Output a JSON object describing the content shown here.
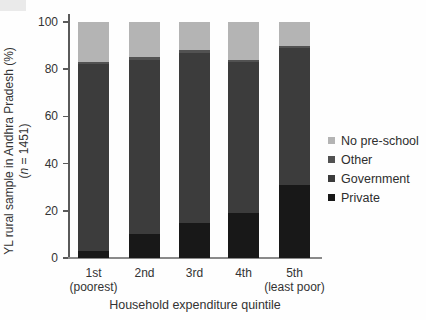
{
  "chart_data": {
    "type": "bar",
    "stacked": true,
    "orientation": "vertical",
    "title": "",
    "xlabel": "Household expenditure quintile",
    "ylabel": "YL rural sample in Andhra Pradesh (%) (n = 1451)",
    "ylabel_line1": "YL rural sample in Andhra Pradesh (%)",
    "ylabel_line2_prefix": "(",
    "ylabel_line2_n": "n",
    "ylabel_line2_suffix": " = 1451)",
    "categories": [
      "1st",
      "2nd",
      "3rd",
      "4th",
      "5th"
    ],
    "category_sublabels": [
      "(poorest)",
      "",
      "",
      "",
      "(least poor)"
    ],
    "yticks": [
      0,
      20,
      40,
      60,
      80,
      100
    ],
    "ylim": [
      0,
      100
    ],
    "grid": false,
    "series": [
      {
        "name": "Private",
        "color": "#181818",
        "values": [
          3,
          10,
          15,
          19,
          31
        ]
      },
      {
        "name": "Government",
        "color": "#3c3c3c",
        "values": [
          79,
          74,
          72,
          64,
          58
        ]
      },
      {
        "name": "Other",
        "color": "#525252",
        "values": [
          1,
          1,
          1,
          1,
          1
        ]
      },
      {
        "name": "No pre-school",
        "color": "#b4b4b4",
        "values": [
          17,
          15,
          12,
          16,
          10
        ]
      }
    ],
    "legend": {
      "position": "right",
      "order_top_to_bottom": [
        "No pre-school",
        "Other",
        "Government",
        "Private"
      ]
    }
  }
}
